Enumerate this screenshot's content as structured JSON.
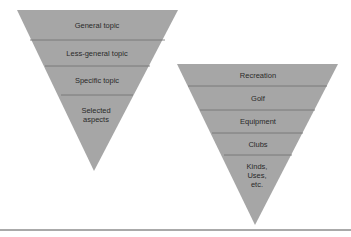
{
  "diagram": {
    "colors": {
      "fill": "#a6a6a6",
      "divider": "#6f6f6f",
      "text": "#2a2a2a",
      "rule": "#555555"
    },
    "funnels": [
      {
        "name": "generic-funnel",
        "levels": [
          {
            "label": "General topic"
          },
          {
            "label": "Less-general topic"
          },
          {
            "label": "Specific topic"
          },
          {
            "label": "Selected\naspects"
          }
        ]
      },
      {
        "name": "example-funnel",
        "levels": [
          {
            "label": "Recreation"
          },
          {
            "label": "Golf"
          },
          {
            "label": "Equipment"
          },
          {
            "label": "Clubs"
          },
          {
            "label": "Kinds,\nUses,\netc."
          }
        ]
      }
    ]
  }
}
